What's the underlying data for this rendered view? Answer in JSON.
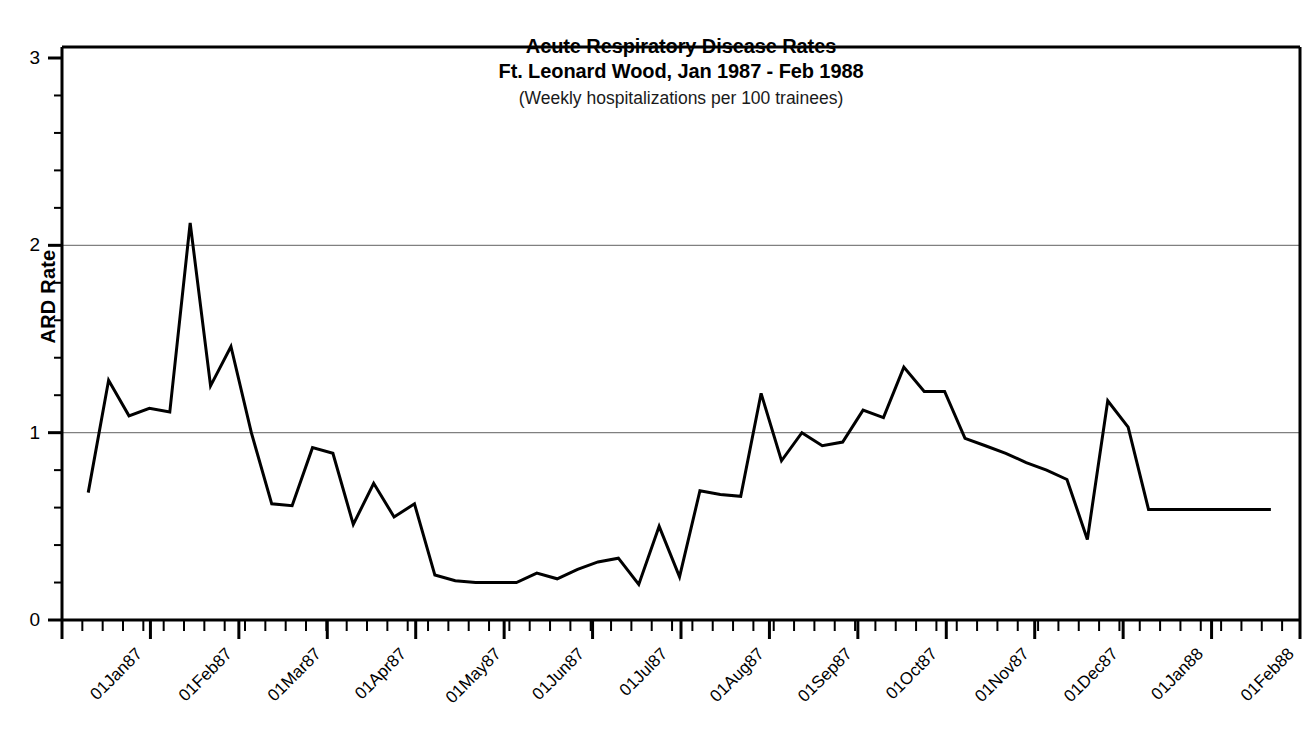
{
  "chart_data": {
    "type": "line",
    "title": "Acute Respiratory Disease Rates",
    "title_line2": "Ft. Leonard Wood, Jan 1987 - Feb 1988",
    "subtitle": "(Weekly hospitalizations per 100 trainees)",
    "xlabel": "",
    "ylabel": "ARD Rate",
    "ylim": [
      0,
      3
    ],
    "ytick_labels": [
      "0",
      "1",
      "2",
      "3"
    ],
    "ytick_values": [
      0,
      1,
      2,
      3
    ],
    "y_minor_step": 0.2,
    "grid": "horizontal-major-at-1-and-2",
    "gridlines": [
      1,
      2
    ],
    "legend": "none",
    "line_color": "#000000",
    "grid_color": "#808080",
    "axis_color": "#000000",
    "xlim": [
      "01Jan87",
      "01Mar88"
    ],
    "xtick_labels": [
      "01Jan87",
      "01Feb87",
      "01Mar87",
      "01Apr87",
      "01May87",
      "01Jun87",
      "01Jul87",
      "01Aug87",
      "01Sep87",
      "01Oct87",
      "01Nov87",
      "01Dec87",
      "01Jan88",
      "01Feb88",
      "01Mar88"
    ],
    "x_minor_tick_interval": "1 week",
    "x": [
      "1987-01-10",
      "1987-01-17",
      "1987-01-24",
      "1987-01-31",
      "1987-02-07",
      "1987-02-14",
      "1987-02-21",
      "1987-02-28",
      "1987-03-07",
      "1987-03-14",
      "1987-03-21",
      "1987-03-28",
      "1987-04-04",
      "1987-04-11",
      "1987-04-18",
      "1987-04-25",
      "1987-05-02",
      "1987-05-09",
      "1987-05-16",
      "1987-05-23",
      "1987-05-30",
      "1987-06-06",
      "1987-06-13",
      "1987-06-20",
      "1987-06-27",
      "1987-07-04",
      "1987-07-11",
      "1987-07-18",
      "1987-07-25",
      "1987-08-01",
      "1987-08-08",
      "1987-08-15",
      "1987-08-22",
      "1987-08-29",
      "1987-09-05",
      "1987-09-12",
      "1987-09-19",
      "1987-09-26",
      "1987-10-03",
      "1987-10-10",
      "1987-10-17",
      "1987-10-24",
      "1987-10-31",
      "1987-11-07",
      "1987-11-14",
      "1987-11-21",
      "1987-11-28",
      "1987-12-05",
      "1987-12-12",
      "1987-12-19",
      "1987-12-26",
      "1988-01-02",
      "1988-01-09",
      "1988-01-16",
      "1988-01-23",
      "1988-01-30",
      "1988-02-06",
      "1988-02-13",
      "1988-02-20"
    ],
    "values": [
      0.68,
      1.28,
      1.09,
      1.13,
      1.11,
      2.12,
      1.25,
      1.46,
      1.0,
      0.62,
      0.61,
      0.92,
      0.89,
      0.51,
      0.73,
      0.55,
      0.62,
      0.24,
      0.21,
      0.2,
      0.2,
      0.2,
      0.25,
      0.22,
      0.27,
      0.31,
      0.33,
      0.19,
      0.5,
      0.23,
      0.69,
      0.67,
      0.66,
      1.21,
      0.85,
      1.0,
      0.93,
      0.95,
      1.12,
      1.08,
      1.35,
      1.22,
      1.22,
      0.97,
      0.93,
      0.89,
      0.84,
      0.8,
      0.75,
      0.43,
      1.17,
      1.03,
      0.59,
      0.59,
      0.59,
      0.59,
      0.59,
      0.59,
      0.59
    ],
    "pixel_points": [
      [
        113,
        493
      ],
      [
        131,
        381
      ],
      [
        149,
        416
      ],
      [
        167,
        408
      ],
      [
        185,
        412
      ],
      [
        203,
        228
      ],
      [
        221,
        386
      ],
      [
        240,
        347
      ],
      [
        258,
        433
      ],
      [
        276,
        504
      ],
      [
        294,
        506
      ],
      [
        312,
        460
      ],
      [
        330,
        466
      ],
      [
        348,
        528
      ],
      [
        366,
        487
      ],
      [
        384,
        517
      ],
      [
        402,
        504
      ],
      [
        421,
        575
      ],
      [
        439,
        581
      ],
      [
        457,
        583
      ],
      [
        475,
        583
      ],
      [
        493,
        583
      ],
      [
        511,
        573
      ],
      [
        529,
        579
      ],
      [
        547,
        569
      ],
      [
        565,
        562
      ],
      [
        583,
        558
      ],
      [
        601,
        585
      ],
      [
        620,
        527
      ],
      [
        638,
        577
      ],
      [
        656,
        490
      ],
      [
        674,
        494
      ],
      [
        692,
        496
      ],
      [
        710,
        393
      ],
      [
        728,
        461
      ],
      [
        746,
        433
      ],
      [
        764,
        446
      ],
      [
        782,
        442
      ],
      [
        801,
        410
      ],
      [
        819,
        418
      ],
      [
        837,
        368
      ],
      [
        855,
        395
      ],
      [
        873,
        395
      ],
      [
        891,
        438
      ],
      [
        909,
        446
      ],
      [
        927,
        453
      ],
      [
        945,
        462
      ],
      [
        963,
        470
      ],
      [
        982,
        479
      ],
      [
        1000,
        539
      ],
      [
        1018,
        414
      ],
      [
        1036,
        440
      ],
      [
        1054,
        523
      ],
      [
        1072,
        523
      ],
      [
        1090,
        523
      ],
      [
        1108,
        523
      ],
      [
        1126,
        523
      ],
      [
        1144,
        523
      ],
      [
        1162,
        523
      ]
    ]
  },
  "axes": {
    "plot_left": 62,
    "plot_right": 1300,
    "plot_top": 47,
    "plot_bottom": 620
  }
}
